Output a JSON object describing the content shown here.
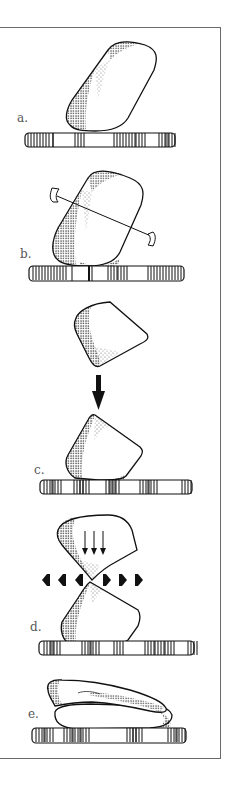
{
  "figure": {
    "panels": [
      {
        "id": "a",
        "label": "a.",
        "description": "stone resting on rod"
      },
      {
        "id": "b",
        "label": "b.",
        "description": "stone with axis pin on rod"
      },
      {
        "id": "c",
        "label": "c.",
        "description": "stone fragment dropped onto rod (downward arrow)"
      },
      {
        "id": "d",
        "label": "d.",
        "description": "two fragments meeting with compression arrows and lateral arrows"
      },
      {
        "id": "e",
        "label": "e.",
        "description": "flattened stacked stones on rod"
      }
    ],
    "colors": {
      "ink": "#111111",
      "frame": "#6a6a6a",
      "label": "#555555",
      "background": "#ffffff"
    }
  }
}
